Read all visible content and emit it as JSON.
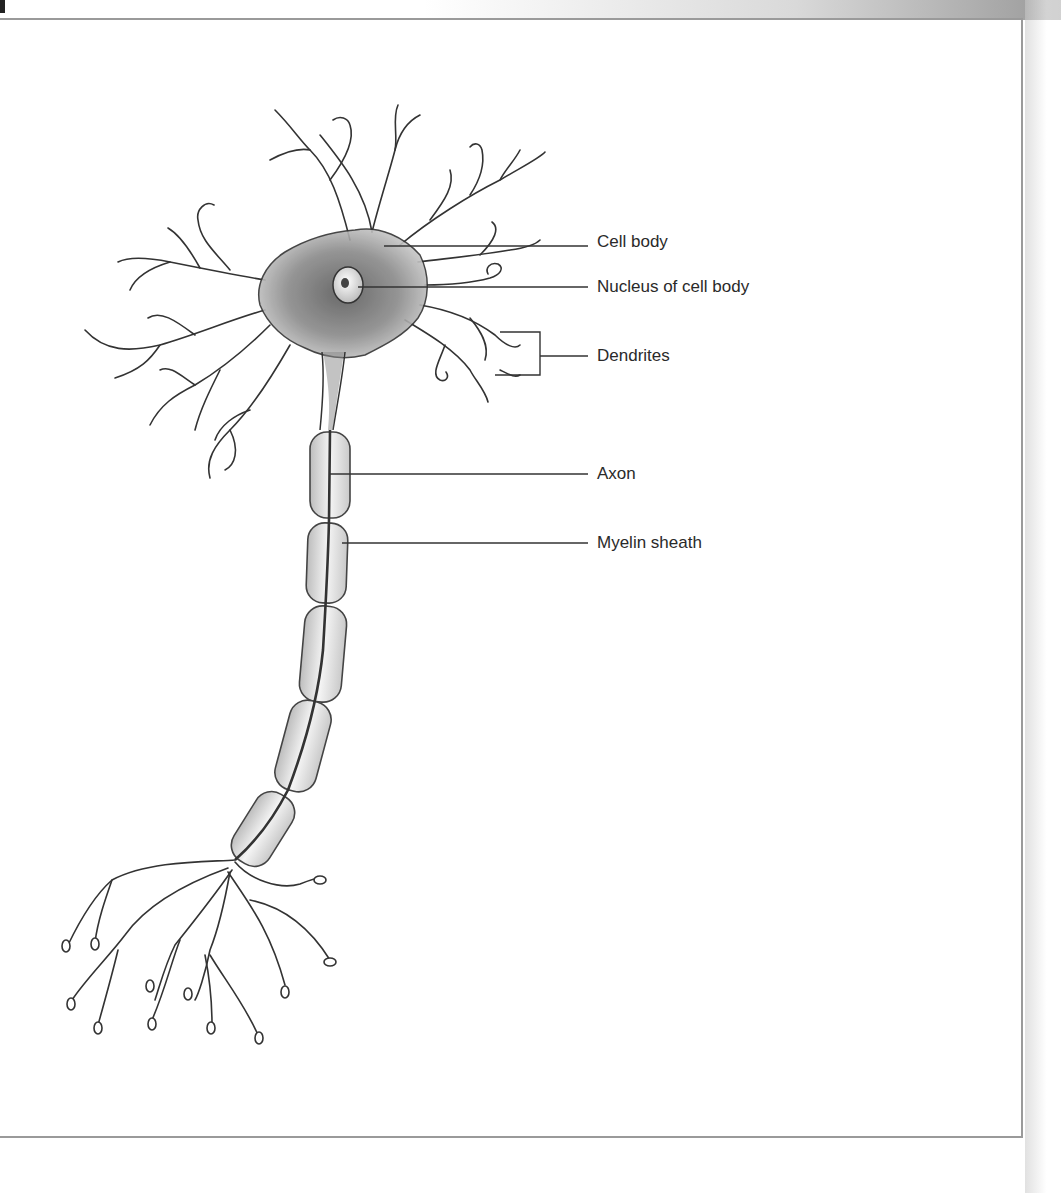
{
  "diagram": {
    "labels": [
      {
        "id": "cell-body",
        "text": "Cell body",
        "x": 597,
        "y": 232
      },
      {
        "id": "nucleus",
        "text": "Nucleus of cell body",
        "x": 597,
        "y": 277
      },
      {
        "id": "dendrites",
        "text": "Dendrites",
        "x": 597,
        "y": 346
      },
      {
        "id": "axon",
        "text": "Axon",
        "x": 597,
        "y": 464
      },
      {
        "id": "myelin-sheath",
        "text": "Myelin sheath",
        "x": 597,
        "y": 533
      }
    ],
    "leader_lines": [
      {
        "id": "cell-body",
        "from": [
          384,
          246
        ],
        "to": [
          588,
          246
        ]
      },
      {
        "id": "nucleus",
        "from": [
          358,
          287
        ],
        "to": [
          588,
          287
        ]
      },
      {
        "id": "dendrites",
        "from": [
          540,
          356
        ],
        "to": [
          588,
          356
        ]
      },
      {
        "id": "axon",
        "from": [
          330,
          474
        ],
        "to": [
          588,
          474
        ]
      },
      {
        "id": "myelin-sheath",
        "from": [
          342,
          543
        ],
        "to": [
          588,
          543
        ]
      }
    ],
    "colors": {
      "ink": "#333333",
      "label_text": "#2a2a2a",
      "frame": "#9a9a9a",
      "sheath_fill": "#e6e6e6"
    }
  }
}
